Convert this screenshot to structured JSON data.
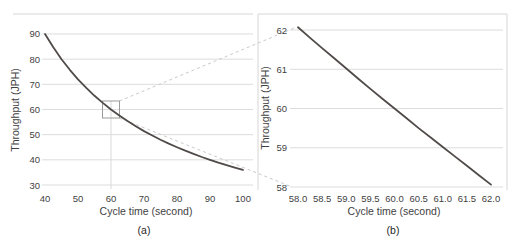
{
  "figure": {
    "width_px": 515,
    "height_px": 252,
    "background": "#ffffff"
  },
  "colors": {
    "curve": "#504b49",
    "gridline": "#dcdcdc",
    "frame": "#d6d6d6",
    "drop_line": "#d9d9d9",
    "connector": "#c9c9c9",
    "zoom_box": "#9b9b9b",
    "tick_text": "#3f3f3f",
    "title_text": "#3f3f3f",
    "caption_text": "#262626"
  },
  "chart_data": [
    {
      "type": "line",
      "panel": "a",
      "caption": "(a)",
      "xlabel": "Cycle time (second)",
      "ylabel": "Throughput (JPH)",
      "xlim": [
        40,
        100
      ],
      "ylim": [
        30,
        90
      ],
      "grid": "horizontal",
      "legend": "none",
      "xtick_values": [
        40,
        50,
        60,
        70,
        80,
        90,
        100
      ],
      "xtick_labels": [
        "40",
        "50",
        "60",
        "70",
        "80",
        "90",
        "100"
      ],
      "ytick_values": [
        30,
        40,
        50,
        60,
        70,
        80,
        90
      ],
      "ytick_labels": [
        "30",
        "40",
        "50",
        "60",
        "70",
        "80",
        "90"
      ],
      "series": [
        {
          "name": "throughput-vs-cycle-time",
          "x": [
            40,
            42.5,
            45,
            47.5,
            50,
            52.5,
            55,
            57.5,
            60,
            62.5,
            65,
            67.5,
            70,
            72.5,
            75,
            77.5,
            80,
            82.5,
            85,
            87.5,
            90,
            92.5,
            95,
            97.5,
            100
          ],
          "y": [
            90,
            84.71,
            80,
            75.79,
            72,
            68.57,
            65.45,
            62.61,
            60,
            57.6,
            55.38,
            53.33,
            51.43,
            49.66,
            48,
            46.45,
            45,
            43.64,
            42.35,
            41.14,
            40,
            38.92,
            37.89,
            36.92,
            36
          ]
        }
      ],
      "annotations": {
        "zoom_box": {
          "center_x": 60,
          "center_y": 60
        },
        "drop_line_x": 60
      }
    },
    {
      "type": "line",
      "panel": "b",
      "caption": "(b)",
      "xlabel": "Cycle time (second)",
      "ylabel": "Throughput (JPH)",
      "xlim": [
        58.0,
        62.0
      ],
      "ylim": [
        58,
        62
      ],
      "grid": "horizontal",
      "legend": "none",
      "xtick_values": [
        58.0,
        58.5,
        59.0,
        59.5,
        60.0,
        60.5,
        61.0,
        61.5,
        62.0
      ],
      "xtick_labels": [
        "58.0",
        "58.5",
        "59.0",
        "59.5",
        "60.0",
        "60.5",
        "61.0",
        "61.5",
        "62.0"
      ],
      "ytick_values": [
        58,
        59,
        60,
        61,
        62
      ],
      "ytick_labels": [
        "58",
        "59",
        "60",
        "61",
        "62"
      ],
      "series": [
        {
          "name": "throughput-vs-cycle-time-zoomed",
          "x": [
            58,
            58.25,
            58.5,
            58.75,
            59,
            59.25,
            59.5,
            59.75,
            60,
            60.25,
            60.5,
            60.75,
            61,
            61.25,
            61.5,
            61.75,
            62
          ],
          "y": [
            62.07,
            61.8,
            61.54,
            61.28,
            61.02,
            60.76,
            60.5,
            60.25,
            60,
            59.75,
            59.5,
            59.26,
            59.02,
            58.78,
            58.54,
            58.3,
            58.06
          ]
        }
      ],
      "annotations": {}
    }
  ]
}
